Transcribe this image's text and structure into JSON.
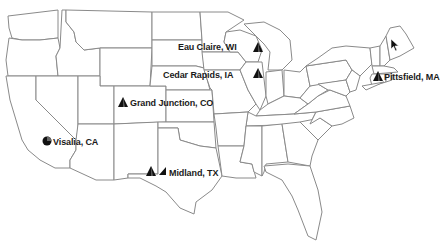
{
  "map": {
    "title": "United States locations map",
    "colors": {
      "border": "#8a8a8a",
      "marker": "#111111",
      "text": "#1a1a1a",
      "background": "#ffffff"
    }
  },
  "locations": [
    {
      "name": "Eau Claire, WI",
      "icon": "triangle-marker-icon",
      "x": 255,
      "y": 47
    },
    {
      "name": "Cedar Rapids, IA",
      "icon": "triangle-marker-icon",
      "x": 255,
      "y": 75
    },
    {
      "name": "Grand Junction, CO",
      "icon": "triangle-marker-icon",
      "x": 122,
      "y": 103
    },
    {
      "name": "Visalia, CA",
      "icon": "circle-marker-icon",
      "x": 48,
      "y": 141
    },
    {
      "name": "Midland, TX",
      "icon": "triangle-and-bar-marker-icon",
      "x": 152,
      "y": 172
    },
    {
      "name": "Pittsfield, MA",
      "icon": "triangle-marker-icon",
      "x": 375,
      "y": 76
    }
  ],
  "labels": {
    "eau_claire": "Eau Claire, WI",
    "cedar_rapids": "Cedar Rapids, IA",
    "grand_junction": "Grand Junction, CO",
    "visalia": "Visalia, CA",
    "midland": "Midland, TX",
    "pittsfield": "Pittsfield, MA"
  }
}
